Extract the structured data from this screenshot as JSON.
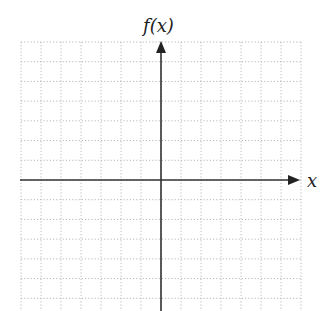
{
  "diagram": {
    "type": "coordinate-grid",
    "x_axis_label": "x",
    "y_axis_label": "f(x)",
    "grid": {
      "columns": 14,
      "rows_above_axis": 7,
      "rows_below_axis": 6.6,
      "line_style": "dotted",
      "line_color": "#b8b8b8"
    },
    "axes": {
      "color": "#333333",
      "x_arrow": "right",
      "y_arrow": "up"
    }
  }
}
